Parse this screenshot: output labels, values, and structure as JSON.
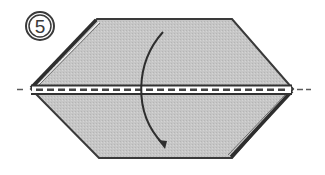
{
  "diagram": {
    "type": "origami-instruction",
    "step_number": "5",
    "step_label": "⑤",
    "instruction": "Valley fold the top half down along the center line",
    "colors": {
      "paper_fill": "#c9c9c9",
      "outline": "#3a3a3a",
      "fold_band": "#ffffff",
      "arrow": "#2e2e2e"
    },
    "elements": [
      {
        "id": "step-number",
        "label": "⑤"
      },
      {
        "id": "paper-shape",
        "label": "hexagonal folded paper"
      },
      {
        "id": "valley-fold-line",
        "label": "dashed center fold line"
      },
      {
        "id": "fold-arrow",
        "label": "curved arrow pointing down"
      }
    ]
  }
}
